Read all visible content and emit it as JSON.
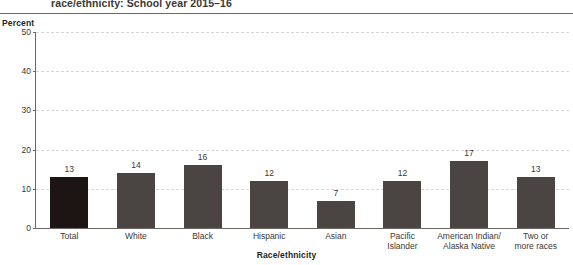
{
  "figure": {
    "title_visible_line": "race/ethnicity: School year 2015–16",
    "y_axis_title": "Percent",
    "x_axis_title": "Race/ethnicity"
  },
  "colors": {
    "bar": "#4a4542",
    "bar_highlight": "#1c1513",
    "axis": "#6d6764",
    "gridline": "#d9d7d6",
    "text": "#3b3735"
  },
  "chart_data": {
    "type": "bar",
    "title": "race/ethnicity: School year 2015–16",
    "xlabel": "Race/ethnicity",
    "ylabel": "Percent",
    "ylim": [
      0,
      50
    ],
    "yticks": [
      0,
      10,
      20,
      30,
      40,
      50
    ],
    "grid": true,
    "legend": "none",
    "categories": [
      "Total",
      "White",
      "Black",
      "Hispanic",
      "Asian",
      "Pacific Islander",
      "American Indian/ Alaska Native",
      "Two or more races"
    ],
    "category_lines": [
      [
        "Total"
      ],
      [
        "White"
      ],
      [
        "Black"
      ],
      [
        "Hispanic"
      ],
      [
        "Asian"
      ],
      [
        "Pacific",
        "Islander"
      ],
      [
        "American Indian/",
        "Alaska Native"
      ],
      [
        "Two or",
        "more races"
      ]
    ],
    "values": [
      13,
      14,
      16,
      12,
      7,
      12,
      17,
      13
    ],
    "value_labels": [
      "13",
      "14",
      "16",
      "12",
      "7",
      "12",
      "17",
      "13"
    ],
    "highlight_index": 0
  },
  "yticklabels": [
    "50",
    "40",
    "30",
    "20",
    "10",
    "0"
  ]
}
